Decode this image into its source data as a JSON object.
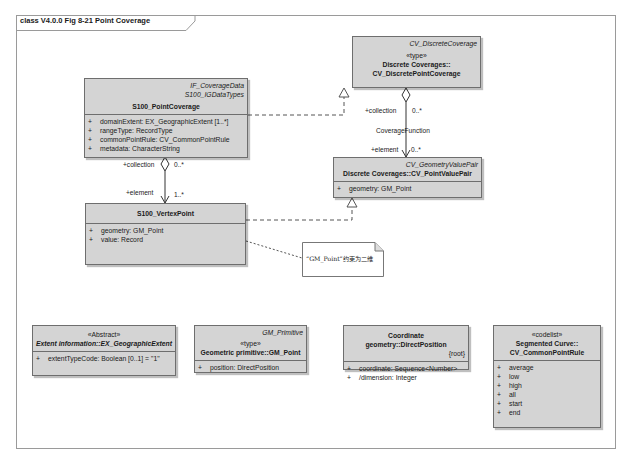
{
  "frame": {
    "title": "class V4.0.0 Fig 8-21 Point Coverage"
  },
  "classes": {
    "discrete_point_coverage": {
      "parent": "CV_DiscreteCoverage",
      "stereotype": "«type»",
      "name_line1": "Discrete Coverages::",
      "name_line2": "CV_DiscretePointCoverage"
    },
    "point_coverage": {
      "parent1": "IF_CoverageData",
      "parent2": "S100_IGDataTypes",
      "name": "S100_PointCoverage",
      "attributes": [
        {
          "vis": "+",
          "text": "domainExtent:  EX_GeographicExtent [1..*]"
        },
        {
          "vis": "+",
          "text": "rangeType:  RecordType"
        },
        {
          "vis": "+",
          "text": "commonPointRule:  CV_CommonPointRule"
        },
        {
          "vis": "+",
          "text": "metadata:  CharacterString"
        }
      ]
    },
    "point_value_pair": {
      "parent": "CV_GeometryValuePair",
      "name": "Discrete Coverages::CV_PointValuePair",
      "attributes": [
        {
          "vis": "+",
          "text": "geometry:  GM_Point"
        }
      ]
    },
    "vertex_point": {
      "name": "S100_VertexPoint",
      "attributes": [
        {
          "vis": "+",
          "text": "geometry:  GM_Point"
        },
        {
          "vis": "+",
          "text": "value:  Record"
        }
      ]
    },
    "geographic_extent": {
      "stereotype": "«Abstract»",
      "name": "Extent information::EX_GeographicExtent",
      "attributes": [
        {
          "vis": "+",
          "text": "extentTypeCode:  Boolean [0..1] = \"1\""
        }
      ]
    },
    "gm_point": {
      "parent": "GM_Primitive",
      "stereotype": "«type»",
      "name": "Geometric primitive::GM_Point",
      "attributes": [
        {
          "vis": "+",
          "text": "position:  DirectPosition"
        }
      ]
    },
    "direct_position": {
      "name": "Coordinate geometry::DirectPosition",
      "tag": "{root}",
      "attributes": [
        {
          "vis": "+",
          "text": "coordinate:  Sequence<Number>"
        },
        {
          "vis": "+",
          "text": "/dimension:  Integer"
        }
      ]
    },
    "common_point_rule": {
      "stereotype": "«codelist»",
      "name_line1": "Segmented Curve::",
      "name_line2": "CV_CommonPointRule",
      "attributes": [
        {
          "vis": "+",
          "text": "average"
        },
        {
          "vis": "+",
          "text": "low"
        },
        {
          "vis": "+",
          "text": "high"
        },
        {
          "vis": "+",
          "text": "all"
        },
        {
          "vis": "+",
          "text": "start"
        },
        {
          "vis": "+",
          "text": "end"
        }
      ]
    }
  },
  "associations": {
    "point_coverage_vertex": {
      "source_role": "+collection",
      "source_mult": "0..*",
      "target_role": "+element",
      "target_mult": "1..*"
    },
    "coverage_function": {
      "name": "CoverageFunction",
      "source_role": "+collection",
      "source_mult": "0..*",
      "target_role": "+element",
      "target_mult": "0..*"
    }
  },
  "note": {
    "text": "“GM_Point”约束为二维"
  },
  "colors": {
    "class_fill": "#d4d4d4",
    "border": "#6e6e6e",
    "frame": "#9a9a9a"
  }
}
